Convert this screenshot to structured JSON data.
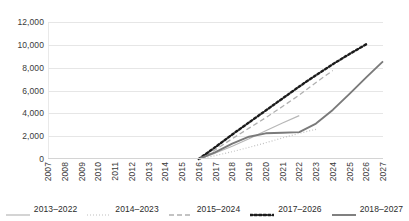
{
  "chart_data": {
    "type": "line",
    "title": "",
    "subtitle": "",
    "xlabel": "",
    "ylabel": "",
    "x": [
      2007,
      2008,
      2009,
      2010,
      2011,
      2012,
      2013,
      2014,
      2015,
      2016,
      2017,
      2018,
      2019,
      2020,
      2021,
      2022,
      2023,
      2024,
      2025,
      2026,
      2027
    ],
    "xlim": [
      2007,
      2027
    ],
    "ylim": [
      0,
      12000
    ],
    "yticks": [
      0,
      2000,
      4000,
      6000,
      8000,
      10000,
      12000
    ],
    "ytick_labels": [
      "0",
      "2,000",
      "4,000",
      "6,000",
      "8,000",
      "10,000",
      "12,000"
    ],
    "grid": "horizontal",
    "legend_position": "bottom",
    "series": [
      {
        "name": "2013–2022",
        "style": "solid",
        "color": "#b7b7b7",
        "width": 1.2,
        "x": [
          2016,
          2017,
          2018,
          2019,
          2020,
          2021,
          2022
        ],
        "values": [
          0,
          520,
          1120,
          1780,
          2480,
          3150,
          3800
        ]
      },
      {
        "name": "2014–2023",
        "style": "dotted",
        "color": "#c0c0c0",
        "width": 1.2,
        "x": [
          2016,
          2017,
          2018,
          2019,
          2020,
          2021,
          2022,
          2023
        ],
        "values": [
          0,
          300,
          640,
          1020,
          1420,
          1850,
          2250,
          2600
        ]
      },
      {
        "name": "2015–2024",
        "style": "dashed",
        "color": "#b0b0b0",
        "width": 1.3,
        "x": [
          2016,
          2017,
          2018,
          2019,
          2020,
          2021,
          2022,
          2023,
          2024
        ],
        "values": [
          0,
          820,
          1780,
          2700,
          3620,
          4600,
          5600,
          6700,
          7750
        ]
      },
      {
        "name": "2017–2026",
        "style": "thick-dotted",
        "color": "#1c1c1c",
        "width": 2.4,
        "x": [
          2016,
          2017,
          2018,
          2019,
          2020,
          2021,
          2022,
          2023,
          2024,
          2025,
          2026
        ],
        "values": [
          0,
          1050,
          2150,
          3200,
          4250,
          5300,
          6350,
          7350,
          8300,
          9200,
          10050
        ]
      },
      {
        "name": "2018–2027",
        "style": "solid",
        "color": "#7a7a7a",
        "width": 1.9,
        "x": [
          2016,
          2017,
          2018,
          2019,
          2020,
          2021,
          2022,
          2023,
          2024,
          2025,
          2026,
          2027
        ],
        "values": [
          0,
          600,
          1350,
          1950,
          2250,
          2300,
          2350,
          3100,
          4300,
          5700,
          7150,
          8550
        ]
      }
    ]
  }
}
